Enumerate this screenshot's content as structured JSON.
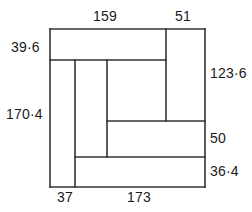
{
  "figure": {
    "units_note": "",
    "line_color": "#333333",
    "background_color": "#ffffff",
    "text_color": "#1a1a1a",
    "outer_rect": {
      "x": 50,
      "y": 29,
      "width": 155,
      "height": 158
    },
    "segments": [
      {
        "name": "outer-top-edge",
        "x1": 50,
        "y1": 29,
        "x2": 205,
        "y2": 29
      },
      {
        "name": "outer-right-edge",
        "x1": 205,
        "y1": 29,
        "x2": 205,
        "y2": 187
      },
      {
        "name": "outer-bottom-edge",
        "x1": 205,
        "y1": 187,
        "x2": 50,
        "y2": 187
      },
      {
        "name": "outer-left-edge",
        "x1": 50,
        "y1": 187,
        "x2": 50,
        "y2": 29
      },
      {
        "name": "inner-horizontal-upper",
        "x1": 50,
        "y1": 60,
        "x2": 166,
        "y2": 60
      },
      {
        "name": "inner-horizontal-mid",
        "x1": 107,
        "y1": 121,
        "x2": 205,
        "y2": 121
      },
      {
        "name": "inner-horizontal-lower",
        "x1": 75,
        "y1": 157,
        "x2": 205,
        "y2": 157
      },
      {
        "name": "inner-vertical-left",
        "x1": 75,
        "y1": 60,
        "x2": 75,
        "y2": 187
      },
      {
        "name": "inner-vertical-mid",
        "x1": 107,
        "y1": 60,
        "x2": 107,
        "y2": 157
      },
      {
        "name": "inner-vertical-right",
        "x1": 166,
        "y1": 29,
        "x2": 166,
        "y2": 121
      }
    ],
    "dimensions": {
      "top": [
        {
          "key": "top_159",
          "value": "159",
          "side": "top"
        },
        {
          "key": "top_51",
          "value": "51",
          "side": "top"
        }
      ],
      "left": [
        {
          "key": "left_39_6",
          "value": "39·6",
          "side": "left"
        },
        {
          "key": "left_170_4",
          "value": "170·4",
          "side": "left"
        }
      ],
      "right": [
        {
          "key": "right_123_6",
          "value": "123·6",
          "side": "right"
        },
        {
          "key": "right_50",
          "value": "50",
          "side": "right"
        },
        {
          "key": "right_36_4",
          "value": "36·4",
          "side": "right"
        }
      ],
      "bottom": [
        {
          "key": "bottom_37",
          "value": "37",
          "side": "bottom"
        },
        {
          "key": "bottom_173",
          "value": "173",
          "side": "bottom"
        }
      ]
    },
    "labels": {
      "top_159": "159",
      "top_51": "51",
      "left_39_6": "39·6",
      "left_170_4": "170·4",
      "right_123_6": "123·6",
      "right_50": "50",
      "right_36_4": "36·4",
      "bottom_37": "37",
      "bottom_173": "173"
    }
  }
}
